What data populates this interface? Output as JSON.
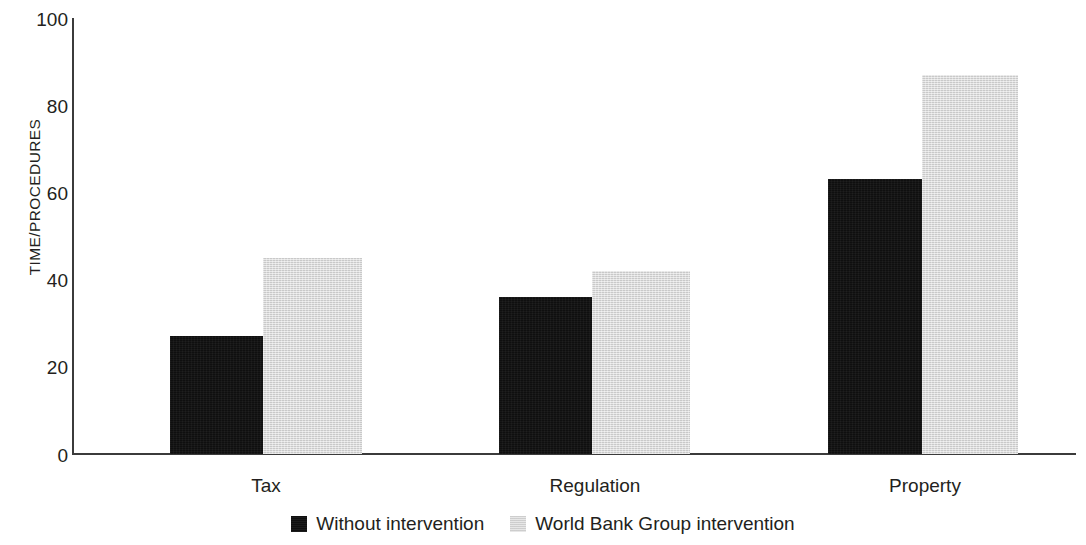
{
  "chart_data": {
    "type": "bar",
    "title": "",
    "subtitle": "",
    "xlabel": "",
    "ylabel": "TIME/PROCEDURES",
    "categories": [
      "Tax",
      "Regulation",
      "Property"
    ],
    "series": [
      {
        "name": "Without intervention",
        "color": "#0f0f0f",
        "values": [
          27,
          36,
          63
        ]
      },
      {
        "name": "World Bank Group intervention",
        "color": "#d4d4d4",
        "values": [
          45,
          42,
          87
        ]
      }
    ],
    "ylim": [
      0,
      100
    ],
    "yticks": [
      0,
      20,
      40,
      60,
      80,
      100
    ],
    "ytick_labels": [
      "0",
      "20",
      "40",
      "60",
      "80",
      "100"
    ],
    "grid": false,
    "legend_position": "bottom-center",
    "axis_color": "#3b3b3b",
    "text_color": "#231f20",
    "background": "#ffffff"
  },
  "axes": {
    "y_title": "TIME/PROCEDURES",
    "y_ticks": [
      "100",
      "80",
      "60",
      "40",
      "20",
      "0"
    ],
    "x_categories": [
      "Tax",
      "Regulation",
      "Property"
    ]
  },
  "legend": {
    "items": [
      {
        "label": "Without intervention",
        "swatch": "dark-square-swatch"
      },
      {
        "label": "World Bank Group intervention",
        "swatch": "light-square-swatch"
      }
    ]
  }
}
